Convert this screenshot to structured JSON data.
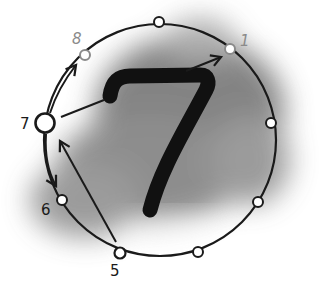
{
  "center_number": "7",
  "labels": {
    "p1": "1",
    "p5": "5",
    "p6": "6",
    "p7": "7",
    "p8": "8"
  },
  "colors": {
    "ink": "#1a1a1a",
    "faint": "#8a8a8a",
    "cloud": "#6e6e6e"
  },
  "points": [
    {
      "id": "8",
      "x": 85,
      "y": 55,
      "style": "faint"
    },
    {
      "id": "top",
      "x": 159,
      "y": 22,
      "style": "normal"
    },
    {
      "id": "1",
      "x": 230,
      "y": 49,
      "style": "faint"
    },
    {
      "id": "right",
      "x": 271,
      "y": 123,
      "style": "normal"
    },
    {
      "id": "lower-right",
      "x": 258,
      "y": 202,
      "style": "normal"
    },
    {
      "id": "bottom-right",
      "x": 198,
      "y": 252,
      "style": "normal"
    },
    {
      "id": "5",
      "x": 120,
      "y": 253,
      "style": "normal"
    },
    {
      "id": "6",
      "x": 62,
      "y": 200,
      "style": "normal"
    },
    {
      "id": "7",
      "x": 45,
      "y": 123,
      "style": "large"
    }
  ],
  "arrows": [
    {
      "from": "7",
      "to": "8"
    },
    {
      "from": "7",
      "to": "1"
    },
    {
      "from": "7",
      "to": "6"
    },
    {
      "from": "5",
      "to": "7"
    }
  ]
}
